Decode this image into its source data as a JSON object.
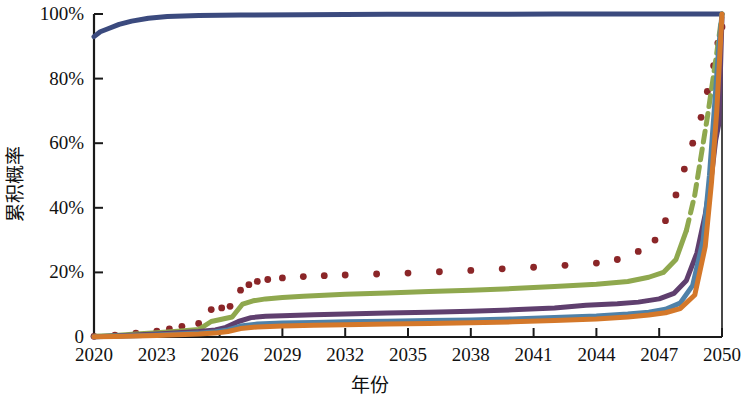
{
  "chart_data": {
    "type": "line",
    "title": "",
    "xlabel": "年份",
    "ylabel": "累积概率",
    "xlim": [
      2020,
      2050
    ],
    "ylim": [
      0,
      1
    ],
    "grid": false,
    "legend": "none",
    "x_tick_labels": [
      "2020",
      "2023",
      "2026",
      "2029",
      "2032",
      "2035",
      "2038",
      "2041",
      "2044",
      "2047",
      "2050"
    ],
    "x_tick_values": [
      2020,
      2023,
      2026,
      2029,
      2032,
      2035,
      2038,
      2041,
      2044,
      2047,
      2050
    ],
    "y_tick_labels": [
      "0",
      "20%",
      "40%",
      "60%",
      "80%",
      "100%"
    ],
    "y_tick_values": [
      0,
      0.2,
      0.4,
      0.6,
      0.8,
      1.0
    ],
    "series": [
      {
        "name": "series-navy",
        "color": "#3b4a7e",
        "style": "solid",
        "width": 5,
        "x": [
          2020,
          2020.3,
          2020.7,
          2021.2,
          2021.8,
          2022.6,
          2023.5,
          2025,
          2027,
          2030,
          2034,
          2038,
          2042,
          2046,
          2048,
          2049.4,
          2050
        ],
        "values": [
          0.93,
          0.945,
          0.955,
          0.968,
          0.978,
          0.987,
          0.992,
          0.995,
          0.997,
          0.998,
          0.999,
          0.999,
          1.0,
          1.0,
          1.0,
          1.0,
          1.0
        ]
      },
      {
        "name": "series-darkred-dotted",
        "color": "#8b2628",
        "style": "dotted",
        "width": 6,
        "x": [
          2020,
          2021,
          2022,
          2023,
          2023.6,
          2024.2,
          2025,
          2025.6,
          2026.1,
          2026.5,
          2027,
          2027.4,
          2027.8,
          2028.3,
          2029,
          2030,
          2031,
          2032,
          2033.5,
          2035,
          2036.5,
          2038,
          2039.5,
          2041,
          2042.5,
          2044,
          2045,
          2046,
          2046.8,
          2047.3,
          2047.8,
          2048.2,
          2048.6,
          2049,
          2049.3,
          2049.6,
          2049.8,
          2050
        ],
        "values": [
          0.002,
          0.006,
          0.012,
          0.018,
          0.025,
          0.033,
          0.042,
          0.085,
          0.09,
          0.095,
          0.145,
          0.162,
          0.172,
          0.178,
          0.183,
          0.187,
          0.19,
          0.192,
          0.195,
          0.198,
          0.202,
          0.206,
          0.211,
          0.216,
          0.222,
          0.229,
          0.24,
          0.265,
          0.3,
          0.36,
          0.44,
          0.52,
          0.6,
          0.68,
          0.76,
          0.84,
          0.91,
          0.96
        ]
      },
      {
        "name": "series-olive-green",
        "color": "#8fa84e",
        "style": "solid-then-dashed",
        "width": 5,
        "x": [
          2020,
          2021,
          2022,
          2023,
          2024,
          2025,
          2025.6,
          2026.1,
          2026.6,
          2027.1,
          2027.6,
          2028.2,
          2029,
          2030,
          2032,
          2034,
          2036,
          2038,
          2040,
          2042,
          2044,
          2045.5,
          2046.5,
          2047.2,
          2047.8,
          2048.3,
          2048.7,
          2049,
          2049.3,
          2049.55,
          2049.75,
          2049.9,
          2050
        ],
        "values": [
          0.002,
          0.005,
          0.009,
          0.013,
          0.018,
          0.023,
          0.048,
          0.055,
          0.062,
          0.102,
          0.112,
          0.118,
          0.122,
          0.126,
          0.132,
          0.136,
          0.141,
          0.145,
          0.15,
          0.156,
          0.163,
          0.172,
          0.185,
          0.2,
          0.24,
          0.33,
          0.44,
          0.56,
          0.68,
          0.79,
          0.88,
          0.95,
          1.0
        ]
      },
      {
        "name": "series-purple",
        "color": "#5f3f6e",
        "style": "solid",
        "width": 5,
        "x": [
          2020,
          2021,
          2022,
          2023,
          2024,
          2025,
          2025.8,
          2026.3,
          2026.9,
          2027.5,
          2028.2,
          2029,
          2030.5,
          2032,
          2034,
          2036,
          2038,
          2040,
          2042,
          2043.5,
          2045,
          2046,
          2047,
          2047.7,
          2048.3,
          2048.8,
          2049.2,
          2049.5,
          2049.7,
          2049.85,
          2050
        ],
        "values": [
          0.001,
          0.003,
          0.006,
          0.009,
          0.013,
          0.017,
          0.022,
          0.03,
          0.048,
          0.06,
          0.064,
          0.066,
          0.069,
          0.071,
          0.074,
          0.077,
          0.08,
          0.084,
          0.09,
          0.098,
          0.103,
          0.108,
          0.118,
          0.135,
          0.175,
          0.26,
          0.38,
          0.5,
          0.61,
          0.66,
          0.99
        ]
      },
      {
        "name": "series-steel-blue",
        "color": "#4f81a8",
        "style": "solid",
        "width": 5,
        "x": [
          2020,
          2021,
          2022,
          2023,
          2024,
          2025,
          2025.8,
          2026.4,
          2027,
          2027.8,
          2029,
          2030.5,
          2032,
          2034,
          2036,
          2038,
          2040,
          2042,
          2044,
          2045.5,
          2046.5,
          2047.3,
          2048,
          2048.6,
          2049.1,
          2049.4,
          2049.65,
          2049.85,
          2050
        ],
        "values": [
          0.001,
          0.002,
          0.004,
          0.006,
          0.009,
          0.012,
          0.016,
          0.022,
          0.034,
          0.04,
          0.043,
          0.045,
          0.047,
          0.049,
          0.051,
          0.053,
          0.056,
          0.06,
          0.065,
          0.071,
          0.077,
          0.086,
          0.105,
          0.16,
          0.3,
          0.5,
          0.72,
          0.9,
          1.0
        ]
      },
      {
        "name": "series-orange",
        "color": "#d4782a",
        "style": "solid",
        "width": 5,
        "x": [
          2020,
          2021,
          2022,
          2023,
          2024,
          2025,
          2025.8,
          2026.4,
          2027,
          2027.8,
          2029,
          2030.5,
          2032,
          2034,
          2036,
          2038,
          2040,
          2042,
          2044,
          2045.5,
          2046.5,
          2047.3,
          2048,
          2048.7,
          2049.2,
          2049.5,
          2049.75,
          2049.9,
          2050
        ],
        "values": [
          0.0005,
          0.0015,
          0.003,
          0.0045,
          0.007,
          0.009,
          0.012,
          0.017,
          0.026,
          0.031,
          0.034,
          0.036,
          0.038,
          0.04,
          0.042,
          0.044,
          0.047,
          0.051,
          0.056,
          0.062,
          0.068,
          0.075,
          0.088,
          0.13,
          0.28,
          0.48,
          0.7,
          0.88,
          1.0
        ]
      }
    ]
  },
  "axis": {
    "x_title": "年份",
    "y_title": "累积概率"
  }
}
